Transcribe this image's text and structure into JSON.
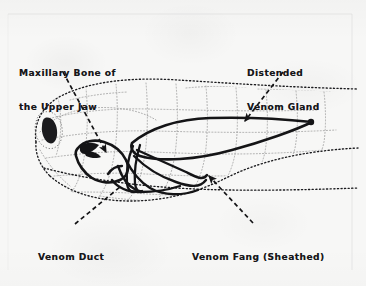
{
  "figure": {
    "style": "stippled line drawing, black ink on off-white paper",
    "background_color": "#f7f7f6",
    "ink_color": "#141416"
  },
  "labels": {
    "maxillary": {
      "line1": "Maxillary Bone of",
      "line2": "the Upper Jaw",
      "text": "Maxillary Bone of the Upper Jaw"
    },
    "gland": {
      "line1": "Distended",
      "line2": "Venom Gland",
      "text": "Distended Venom Gland"
    },
    "duct": {
      "line1": "Venom Duct",
      "text": "Venom Duct"
    },
    "fang": {
      "line1": "Venom Fang (Sheathed)",
      "text": "Venom Fang (Sheathed)"
    }
  },
  "leaders": [
    {
      "name": "leader-maxillary",
      "from_label": "Maxillary Bone of the Upper Jaw",
      "style": "dashed",
      "arrowhead": "yes",
      "points": "63,72 108,155"
    },
    {
      "name": "leader-gland",
      "from_label": "Distended Venom Gland",
      "style": "dashed",
      "arrowhead": "yes",
      "points": "281,74 243,123"
    },
    {
      "name": "leader-duct",
      "from_label": "Venom Duct",
      "style": "dashed",
      "arrowhead": "no",
      "points": "76,223 119,188"
    },
    {
      "name": "leader-fang",
      "from_label": "Venom Fang (Sheathed)",
      "style": "dashed",
      "arrowhead": "yes",
      "points": "251,222 207,174"
    }
  ],
  "anatomy": [
    {
      "name": "head-outline",
      "rendering": "stippled dotted contour"
    },
    {
      "name": "scale-pattern",
      "rendering": "light dotted polygonal cells"
    },
    {
      "name": "eye",
      "rendering": "solid dark almond shape"
    },
    {
      "name": "maxillary-bone",
      "rendering": "heavy black outline"
    },
    {
      "name": "venom-fang-sheathed",
      "rendering": "heavy black curved outline"
    },
    {
      "name": "venom-duct",
      "rendering": "heavy black narrow tube"
    },
    {
      "name": "distended-venom-gland",
      "rendering": "heavy black elongated teardrop"
    }
  ]
}
